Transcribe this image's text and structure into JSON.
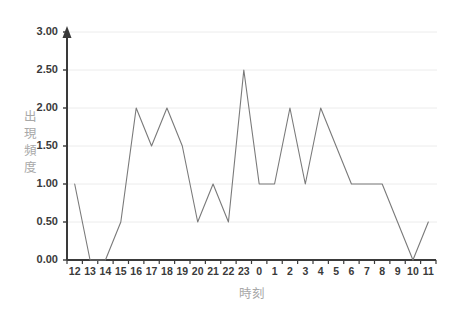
{
  "chart_data": {
    "type": "line",
    "title": "",
    "xlabel": "時刻",
    "ylabel": "出現頻度",
    "categories": [
      "12",
      "13",
      "14",
      "15",
      "16",
      "17",
      "18",
      "19",
      "20",
      "21",
      "22",
      "23",
      "0",
      "1",
      "2",
      "3",
      "4",
      "5",
      "6",
      "7",
      "8",
      "9",
      "10",
      "11"
    ],
    "values": [
      1.0,
      0.0,
      0.0,
      0.5,
      2.0,
      1.5,
      2.0,
      1.5,
      0.5,
      1.0,
      0.5,
      2.5,
      1.0,
      1.0,
      2.0,
      1.0,
      2.0,
      1.5,
      1.0,
      1.0,
      1.0,
      0.5,
      0.0,
      0.5
    ],
    "ylim": [
      0,
      3
    ],
    "ytick_labels": [
      "0.00",
      "0.50",
      "1.00",
      "1.50",
      "2.00",
      "2.50",
      "3.00"
    ],
    "ytick_values": [
      0,
      0.5,
      1.0,
      1.5,
      2.0,
      2.5,
      3.0
    ],
    "grid": true,
    "grid_axis": "y",
    "legend": false,
    "legend_position": "none",
    "series_color": "#7a7a7a",
    "grid_color": "#ececec",
    "axis_color": "#3a3a3a",
    "axis_title_color": "#a8a8a8",
    "tick_label_color": "#3a3a3a",
    "y_axis_arrow": true,
    "ylabel_chars": [
      "出",
      "現",
      "頻",
      "度"
    ]
  }
}
